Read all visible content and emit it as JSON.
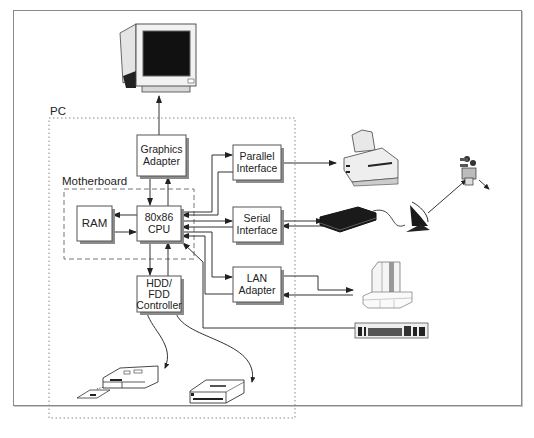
{
  "diagram": {
    "groups": {
      "pc": {
        "label": "PC"
      },
      "motherboard": {
        "label": "Motherboard"
      }
    },
    "blocks": {
      "graphics": {
        "line1": "Graphics",
        "line2": "Adapter"
      },
      "ram": {
        "line1": "RAM"
      },
      "cpu": {
        "line1": "80x86",
        "line2": "CPU"
      },
      "hdd": {
        "line1": "HDD/",
        "line2": "FDD",
        "line3": "Controller"
      },
      "parallel": {
        "line1": "Parallel",
        "line2": "Interface"
      },
      "serial": {
        "line1": "Serial",
        "line2": "Interface"
      },
      "lan": {
        "line1": "LAN",
        "line2": "Adapter"
      }
    },
    "peripherals": [
      {
        "name": "monitor",
        "icon": "crt-monitor-icon"
      },
      {
        "name": "printer",
        "icon": "printer-icon"
      },
      {
        "name": "modem",
        "icon": "modem-icon"
      },
      {
        "name": "satellite-dish",
        "icon": "satellite-dish-icon"
      },
      {
        "name": "satellite",
        "icon": "satellite-icon"
      },
      {
        "name": "mainframe",
        "icon": "mainframe-icon"
      },
      {
        "name": "keyboard",
        "icon": "keyboard-icon"
      },
      {
        "name": "floppy-drive",
        "icon": "floppy-drive-icon"
      },
      {
        "name": "floppy-disk",
        "icon": "floppy-disk-icon"
      },
      {
        "name": "hard-disk",
        "icon": "hard-disk-icon"
      }
    ],
    "colors": {
      "line": "#333333",
      "box_border": "#555555",
      "shadow": "#8c8c8c",
      "frame": "#8a8a8a"
    }
  }
}
